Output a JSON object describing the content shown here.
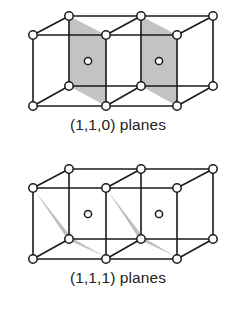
{
  "diagrams": [
    {
      "id": "top",
      "caption": "(1,1,0) planes",
      "plane_type": "110",
      "offset_y": 0
    },
    {
      "id": "bottom",
      "caption": "(1,1,1) planes",
      "plane_type": "111",
      "offset_y": 153
    }
  ],
  "colors": {
    "line": "#1a1a1a",
    "node_fill": "#ffffff",
    "plane_shade": "#b8b8b8"
  },
  "lattice": {
    "cells": 2,
    "front_x": [
      33,
      106,
      177
    ],
    "back_x": [
      69,
      141,
      213
    ],
    "front_top_y": 35,
    "back_top_y": 16,
    "front_bottom_y": 106,
    "back_bottom_y": 86,
    "center_offsets": [
      [
        88,
        61
      ],
      [
        159,
        61
      ]
    ]
  }
}
